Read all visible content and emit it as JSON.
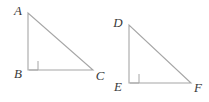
{
  "figure": {
    "name": "two-congruent-right-triangles",
    "background_color": "#ffffff",
    "stroke_color": "#a6a6a6",
    "label_color": "#3a3a3a",
    "stroke_width": 1.1,
    "triangles": [
      {
        "id": "triangle-abc",
        "vertices": [
          {
            "label": "A",
            "x": 28,
            "y": 13,
            "label_x": 18,
            "label_y": 15
          },
          {
            "label": "B",
            "x": 28,
            "y": 70,
            "label_x": 18,
            "label_y": 78
          },
          {
            "label": "C",
            "x": 93,
            "y": 70,
            "label_x": 100,
            "label_y": 80
          }
        ],
        "right_angle_at": "B",
        "right_angle_marker": {
          "x": 29,
          "y": 61,
          "size": 9
        }
      },
      {
        "id": "triangle-def",
        "vertices": [
          {
            "label": "D",
            "x": 129,
            "y": 25,
            "label_x": 118,
            "label_y": 27
          },
          {
            "label": "E",
            "x": 129,
            "y": 83,
            "label_x": 118,
            "label_y": 91
          },
          {
            "label": "F",
            "x": 191,
            "y": 83,
            "label_x": 198,
            "label_y": 92
          }
        ],
        "right_angle_at": "E",
        "right_angle_marker": {
          "x": 130,
          "y": 74,
          "size": 9
        }
      }
    ]
  }
}
